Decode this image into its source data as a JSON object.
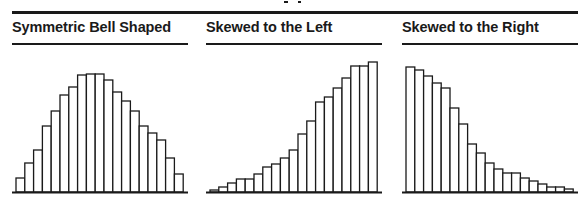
{
  "chart_data": [
    {
      "type": "bar",
      "title": "Symmetric Bell Shaped",
      "xlabel": "",
      "ylabel": "",
      "grid": false,
      "categories": [
        "1",
        "2",
        "3",
        "4",
        "5",
        "6",
        "7",
        "8",
        "9",
        "10",
        "11",
        "12",
        "13",
        "14",
        "15",
        "16",
        "17",
        "18",
        "19"
      ],
      "values": [
        14,
        29,
        42,
        66,
        81,
        97,
        105,
        117,
        118,
        118,
        112,
        100,
        91,
        81,
        66,
        59,
        52,
        34,
        18
      ],
      "ylim": [
        0,
        130
      ]
    },
    {
      "type": "bar",
      "title": "Skewed to the Left",
      "xlabel": "",
      "ylabel": "",
      "grid": false,
      "categories": [
        "1",
        "2",
        "3",
        "4",
        "5",
        "6",
        "7",
        "8",
        "9",
        "10",
        "11",
        "12",
        "13",
        "14",
        "15",
        "16",
        "17",
        "18",
        "19"
      ],
      "values": [
        2,
        5,
        9,
        13,
        13,
        18,
        25,
        28,
        34,
        42,
        58,
        71,
        90,
        95,
        104,
        114,
        126,
        126,
        130
      ],
      "ylim": [
        0,
        130
      ]
    },
    {
      "type": "bar",
      "title": "Skewed to the Right",
      "xlabel": "",
      "ylabel": "",
      "grid": false,
      "categories": [
        "1",
        "2",
        "3",
        "4",
        "5",
        "6",
        "7",
        "8",
        "9",
        "10",
        "11",
        "12",
        "13",
        "14",
        "15",
        "16",
        "17",
        "18",
        "19"
      ],
      "values": [
        125,
        122,
        116,
        109,
        104,
        84,
        68,
        48,
        39,
        29,
        23,
        19,
        19,
        14,
        11,
        8,
        5,
        5,
        3
      ],
      "ylim": [
        0,
        130
      ]
    }
  ],
  "panels": [
    {
      "title": "Symmetric Bell Shaped",
      "left": 12
    },
    {
      "title": "Skewed to the Left",
      "left": 206
    },
    {
      "title": "Skewed to the Right",
      "left": 402
    }
  ],
  "colors": {
    "ink": "#1a1a1a",
    "bar_fill": "#ffffff",
    "background": "#ffffff"
  }
}
